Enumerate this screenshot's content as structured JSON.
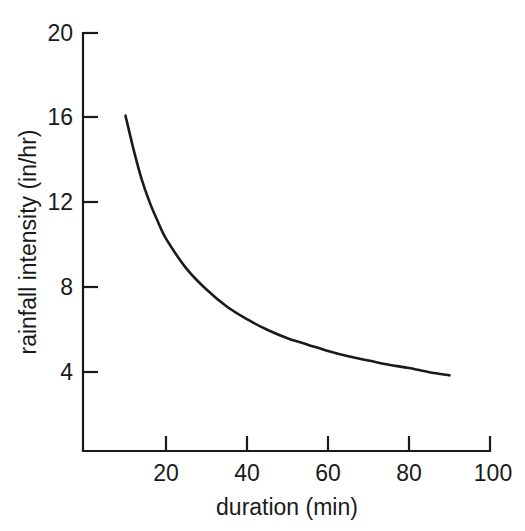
{
  "chart_data": {
    "type": "line",
    "title": "",
    "subtitle": "",
    "xlabel": "duration (min)",
    "ylabel": "rainfall intensity (in/hr)",
    "xlim": [
      0,
      100
    ],
    "ylim": [
      0,
      20
    ],
    "xticks": [
      20,
      40,
      60,
      80,
      100
    ],
    "xticklabels": [
      "20",
      "40",
      "60",
      "80",
      "100"
    ],
    "yticks": [
      4,
      8,
      12,
      16,
      20
    ],
    "yticklabels": [
      "4",
      "8",
      "12",
      "16",
      "20"
    ],
    "grid": false,
    "legend": null,
    "legend_position": "none",
    "annotations": [],
    "series": [
      {
        "name": "rainfall intensity",
        "color": "#1a1a1a",
        "x": [
          10,
          12,
          14,
          16,
          18,
          20,
          25,
          30,
          35,
          40,
          45,
          50,
          55,
          60,
          65,
          70,
          75,
          80,
          85,
          90
        ],
        "values": [
          16.1,
          14.5,
          13.1,
          12.0,
          11.1,
          10.3,
          8.9,
          7.9,
          7.1,
          6.5,
          6.0,
          5.6,
          5.3,
          5.0,
          4.75,
          4.55,
          4.35,
          4.2,
          4.0,
          3.85
        ]
      }
    ]
  },
  "axes": {
    "y_axis_name": "y-axis",
    "x_axis_name": "x-axis"
  }
}
